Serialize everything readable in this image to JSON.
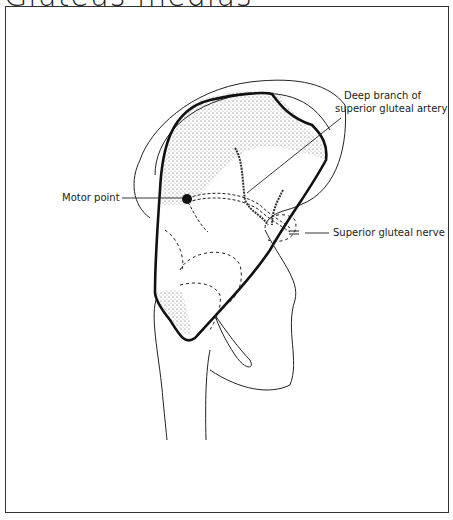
{
  "title": "Gluteus medius",
  "labels": {
    "artery_line1": "Deep branch of",
    "artery_line2": "superior gluteal artery",
    "motor_point": "Motor point",
    "nerve": "Superior gluteal nerve"
  },
  "colors": {
    "ink": "#1a1a1a",
    "background": "#ffffff"
  }
}
